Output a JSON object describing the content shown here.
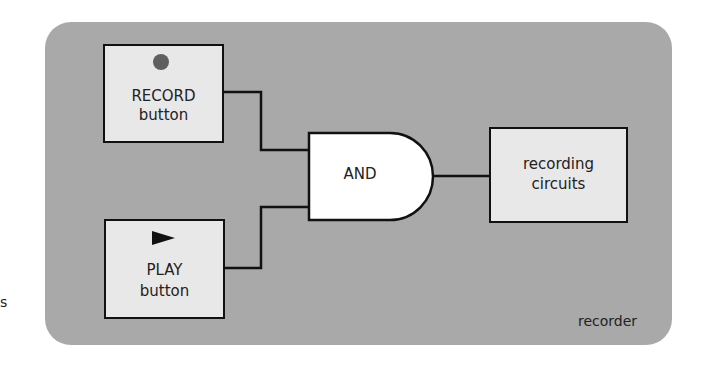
{
  "diagram": {
    "container_label": "recorder",
    "stray_text": "s",
    "inputs": [
      {
        "id": "record",
        "icon": "record-dot-icon",
        "line1": "RECORD",
        "line2": "button"
      },
      {
        "id": "play",
        "icon": "play-triangle-icon",
        "line1": "PLAY",
        "line2": "button"
      }
    ],
    "gate": {
      "type": "AND",
      "label": "AND"
    },
    "output": {
      "line1": "recording",
      "line2": "circuits"
    },
    "colors": {
      "panel": "#a9a9a9",
      "box": "#e8e8e8",
      "gate": "#ffffff",
      "wire": "#111111",
      "record_dot": "#5f5f5f"
    }
  }
}
